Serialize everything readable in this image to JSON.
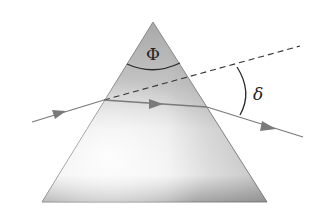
{
  "figure": {
    "labels": {
      "apex_angle": "Φ",
      "deviation_angle": "δ"
    },
    "colors": {
      "background": "#ffffff",
      "prism_light": "#f2f2f2",
      "prism_dark": "#a8a8a8",
      "prism_edge": "#8a8a8a",
      "ray": "#7a7a7a",
      "arc": "#2a2a2a",
      "dashed_line": "#333333"
    }
  }
}
